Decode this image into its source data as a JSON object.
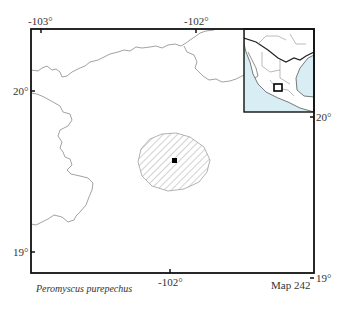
{
  "map": {
    "number_label": "Map 242",
    "species": "Peromyscus purepechus",
    "colors": {
      "frame": "#111111",
      "boundary": "#8a8a8a",
      "range_hatch": "#9a9a9a",
      "inset_water": "#d8eef4",
      "locality": "#000000"
    },
    "axes": {
      "top_ticks": [
        "-103°",
        "-102°"
      ],
      "bottom_ticks": [
        "-102°"
      ],
      "left_ticks": [
        "20°",
        "19°"
      ],
      "right_ticks": [
        "20°",
        "19°"
      ]
    },
    "range": {
      "shape": "circle",
      "pattern": "diagonal-hatch"
    },
    "localities": [
      {
        "marker": "square"
      }
    ],
    "inset": {
      "region": "Mexico",
      "highlight": "study-area-box"
    }
  }
}
